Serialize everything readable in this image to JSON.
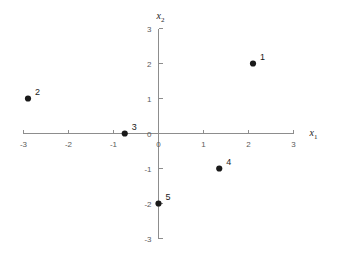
{
  "chart_data": {
    "type": "scatter",
    "title": "",
    "xlabel": "x_1",
    "ylabel": "x_2",
    "xlabel_base": "x",
    "xlabel_sub": "1",
    "ylabel_base": "x",
    "ylabel_sub": "2",
    "xlim": [
      -3,
      3
    ],
    "ylim": [
      -3,
      3
    ],
    "grid": false,
    "legend": "none",
    "xticks": [
      -3,
      -2,
      -1,
      0,
      1,
      2,
      3
    ],
    "xtick_labels": [
      "-3",
      "-2",
      "-1",
      "0",
      "1",
      "2",
      "3"
    ],
    "yticks": [
      -3,
      -2,
      -1,
      0,
      1,
      2,
      3
    ],
    "ytick_labels": [
      "-3",
      "-2",
      "-1",
      "0",
      "1",
      "2",
      "3"
    ],
    "points": [
      {
        "label": "1",
        "x": 2.1,
        "y": 2.0
      },
      {
        "label": "2",
        "x": -2.9,
        "y": 1.0
      },
      {
        "label": "3",
        "x": -0.75,
        "y": 0.0
      },
      {
        "label": "4",
        "x": 1.35,
        "y": -1.0
      },
      {
        "label": "5",
        "x": 0.0,
        "y": -2.0
      }
    ],
    "marker_color": "#1a1a1a",
    "axis_color": "#8d8d8d",
    "tick_label_color": "#5a5a5a",
    "background_color": "#ffffff"
  }
}
